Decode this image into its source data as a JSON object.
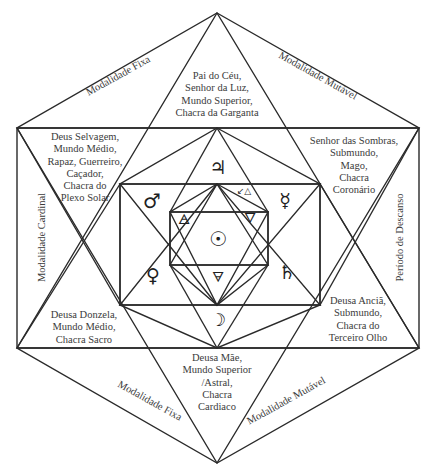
{
  "diagram": {
    "title": "",
    "colors": {
      "line": "#2a2a2a",
      "text": "#3b3b3b",
      "background": "#ffffff"
    },
    "regions": {
      "top": "Pai do Céu,\nSenhor da Luz,\nMundo Superior,\nChacra da Garganta",
      "upper_left": "Deus Selvagem,\nMundo Médio,\nRapaz, Guerreiro,\nCaçador,\nChacra do\nPlexo Solar",
      "upper_right": "Senhor das Sombras,\nSubmundo,\nMago,\nChacra\nCoronário",
      "lower_left": "Deusa Donzela,\nMundo Médio,\nChacra Sacro",
      "lower_right": "Deusa Anciã,\nSubmundo,\nChacra do\nTerceiro Olho",
      "bottom": "Deusa Mãe,\nMundo Superior\n/Astral,\nChacra\nCardiaco"
    },
    "edge_labels": {
      "top_left": "Modalidade Fixa",
      "top_right": "Modalidade Mutável",
      "left": "Modalidade Cardinal",
      "right": "Período de Descanso",
      "bottom_left": "Modalidade Fixa",
      "bottom_right": "Modalidade Mutável"
    },
    "symbols": {
      "jupiter": "♃",
      "mars": "♂",
      "mercury": "☿",
      "venus": "♀",
      "saturn": "♄",
      "sun": "☉",
      "moon": "☽",
      "air": "🜁",
      "water": "🜄",
      "earth": "🜃",
      "fire_arrow": "↙△"
    }
  }
}
